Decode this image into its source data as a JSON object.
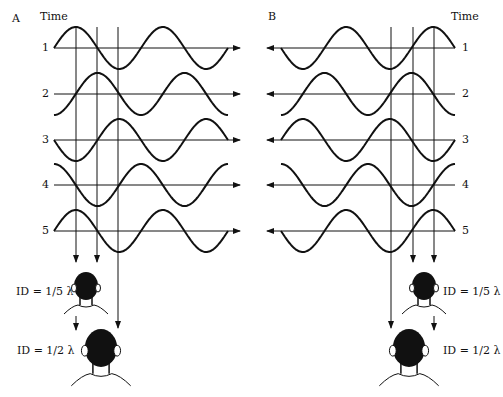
{
  "panels": [
    {
      "id": "A",
      "label": "A",
      "time_label": "Time",
      "rows": [
        "1",
        "2",
        "3",
        "4",
        "5"
      ],
      "direction": "right"
    },
    {
      "id": "B",
      "label": "B",
      "time_label": "Time",
      "rows": [
        "1",
        "2",
        "3",
        "4",
        "5"
      ],
      "direction": "left"
    }
  ],
  "listeners": [
    {
      "panel": "A",
      "label": "ID = 1/5 λ",
      "size": "small"
    },
    {
      "panel": "A",
      "label": "ID = 1/2 λ",
      "size": "large"
    },
    {
      "panel": "B",
      "label": "ID = 1/5 λ",
      "size": "small"
    },
    {
      "panel": "B",
      "label": "ID = 1/2 λ",
      "size": "large"
    }
  ],
  "colors": {
    "ink": "#111111",
    "background": "#ffffff"
  }
}
